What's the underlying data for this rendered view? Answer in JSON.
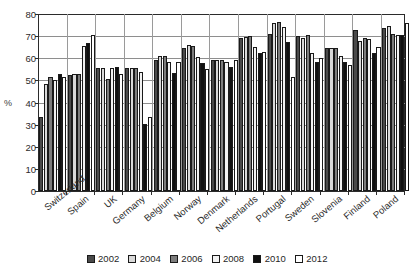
{
  "chart_data": {
    "type": "bar",
    "title": "",
    "xlabel": "",
    "ylabel": "%",
    "ylim": [
      0,
      80
    ],
    "ytick_step": 10,
    "yticks": [
      0,
      10,
      20,
      30,
      40,
      50,
      60,
      70,
      80
    ],
    "grid": true,
    "legend_position": "bottom",
    "categories": [
      "Switzerland",
      "Spain",
      "UK",
      "Germany",
      "Belgium",
      "Norway",
      "Denmark",
      "Netherlands",
      "Portugal",
      "Sweden",
      "Slovenia",
      "Finland",
      "Poland"
    ],
    "series": [
      {
        "name": "2002",
        "color": "#4a4a4a",
        "values": [
          33.5,
          52.5,
          55.5,
          55.5,
          59.0,
          64.5,
          59.0,
          69.0,
          71.0,
          70.0,
          64.5,
          73.0,
          73.5
        ]
      },
      {
        "name": "2004",
        "color": "#d9d9d9",
        "values": [
          48.5,
          53.0,
          55.5,
          55.5,
          61.0,
          66.0,
          59.0,
          69.5,
          76.0,
          69.0,
          64.5,
          68.0,
          74.5
        ]
      },
      {
        "name": "2006",
        "color": "#7d7d7d",
        "values": [
          51.5,
          53.0,
          50.5,
          55.5,
          61.0,
          65.5,
          59.0,
          70.0,
          76.5,
          70.5,
          64.5,
          69.0,
          71.0
        ]
      },
      {
        "name": "2008",
        "color": "#f2f2f2",
        "values": [
          50.0,
          65.5,
          55.5,
          54.0,
          58.5,
          60.5,
          58.5,
          65.0,
          74.0,
          62.5,
          61.0,
          68.5,
          70.5
        ]
      },
      {
        "name": "2010",
        "color": "#101010",
        "values": [
          53.0,
          67.0,
          56.0,
          30.5,
          53.5,
          58.0,
          56.0,
          62.5,
          67.5,
          58.5,
          58.5,
          62.5,
          70.5
        ]
      },
      {
        "name": "2012",
        "color": "#ffffff",
        "values": [
          51.5,
          70.5,
          53.0,
          33.5,
          58.5,
          55.0,
          59.0,
          63.0,
          51.5,
          60.0,
          57.0,
          65.0,
          76.0
        ]
      }
    ]
  },
  "legend": {
    "items": [
      {
        "label": "2002"
      },
      {
        "label": "2004"
      },
      {
        "label": "2006"
      },
      {
        "label": "2008"
      },
      {
        "label": "2010"
      },
      {
        "label": "2012"
      }
    ]
  }
}
